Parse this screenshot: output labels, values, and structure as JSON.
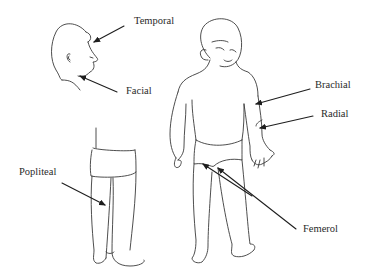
{
  "diagram": {
    "labels": [
      {
        "id": "temporal",
        "text": "Temporal"
      },
      {
        "id": "facial",
        "text": "Facial"
      },
      {
        "id": "brachial",
        "text": "Brachial"
      },
      {
        "id": "radial",
        "text": "Radial"
      },
      {
        "id": "popliteal",
        "text": "Popliteal"
      },
      {
        "id": "femerol",
        "text": "Femerol"
      }
    ],
    "figures": [
      {
        "id": "side-head",
        "view": "head profile (left side)"
      },
      {
        "id": "back-legs",
        "view": "lower body, rear view"
      },
      {
        "id": "front-child",
        "view": "full body, front view"
      }
    ]
  }
}
